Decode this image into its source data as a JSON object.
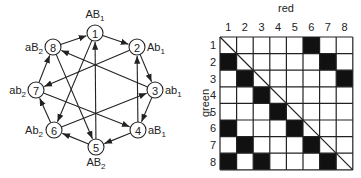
{
  "graph": {
    "nodes": [
      {
        "id": 1,
        "label": "AB",
        "sub": "1"
      },
      {
        "id": 2,
        "label": "Ab",
        "sub": "1"
      },
      {
        "id": 3,
        "label": "ab",
        "sub": "1"
      },
      {
        "id": 4,
        "label": "aB",
        "sub": "1"
      },
      {
        "id": 5,
        "label": "AB",
        "sub": "2"
      },
      {
        "id": 6,
        "label": "Ab",
        "sub": "2"
      },
      {
        "id": 7,
        "label": "ab",
        "sub": "2"
      },
      {
        "id": 8,
        "label": "aB",
        "sub": "2"
      }
    ],
    "edges": [
      [
        8,
        1
      ],
      [
        1,
        2
      ],
      [
        2,
        3
      ],
      [
        3,
        4
      ],
      [
        4,
        5
      ],
      [
        5,
        6
      ],
      [
        6,
        7
      ],
      [
        7,
        8
      ],
      [
        1,
        6
      ],
      [
        5,
        1
      ],
      [
        8,
        5
      ],
      [
        4,
        2
      ],
      [
        2,
        7
      ],
      [
        3,
        8
      ],
      [
        7,
        4
      ],
      [
        6,
        3
      ]
    ]
  },
  "matrix": {
    "x_title": "red",
    "y_title": "green",
    "col_labels": [
      "1",
      "2",
      "3",
      "4",
      "5",
      "6",
      "7",
      "8"
    ],
    "row_labels": [
      "1",
      "2",
      "3",
      "4",
      "5",
      "6",
      "7",
      "8"
    ],
    "filled": [
      [
        1,
        6
      ],
      [
        2,
        1
      ],
      [
        2,
        7
      ],
      [
        3,
        2
      ],
      [
        3,
        8
      ],
      [
        4,
        3
      ],
      [
        5,
        4
      ],
      [
        6,
        1
      ],
      [
        6,
        5
      ],
      [
        7,
        2
      ],
      [
        7,
        6
      ],
      [
        8,
        1
      ],
      [
        8,
        3
      ],
      [
        8,
        7
      ]
    ],
    "diagonal": true
  }
}
